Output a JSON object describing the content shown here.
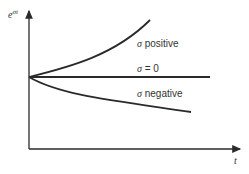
{
  "diagram": {
    "y_axis_label_base": "e",
    "y_axis_label_exp": "σt",
    "x_axis_label": "t",
    "curves": [
      {
        "name": "growth",
        "label_symbol": "σ",
        "label_text": " positive"
      },
      {
        "name": "constant",
        "label_symbol": "σ",
        "label_text": " = 0"
      },
      {
        "name": "decay",
        "label_symbol": "σ",
        "label_text": " negative"
      }
    ],
    "colors": {
      "line": "#2a2a2a",
      "text": "#333333"
    }
  }
}
